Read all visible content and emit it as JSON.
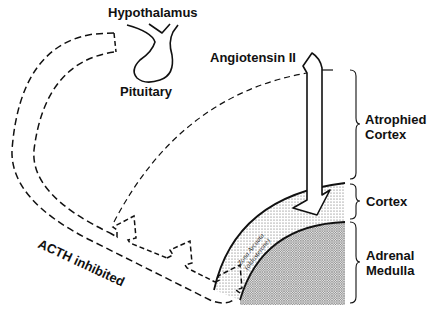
{
  "diagram": {
    "labels": {
      "hypothalamus": "Hypothalamus",
      "pituitary": "Pituitary",
      "angiotensin": "Angiotensin II",
      "atrophied_cortex_line1": "Atrophied",
      "atrophied_cortex_line2": "Cortex",
      "cortex": "Cortex",
      "adrenal_medulla_line1": "Adrenal",
      "adrenal_medulla_line2": "Medulla",
      "acth": "ACTH inhibited",
      "zona_line1": "Zona Arcuata",
      "zona_line2": "(aldosterone)"
    },
    "colors": {
      "stroke": "#111111",
      "background": "#ffffff",
      "cortex_fill": "#d9d9d9",
      "medulla_fill": "#bdbdbd"
    }
  }
}
